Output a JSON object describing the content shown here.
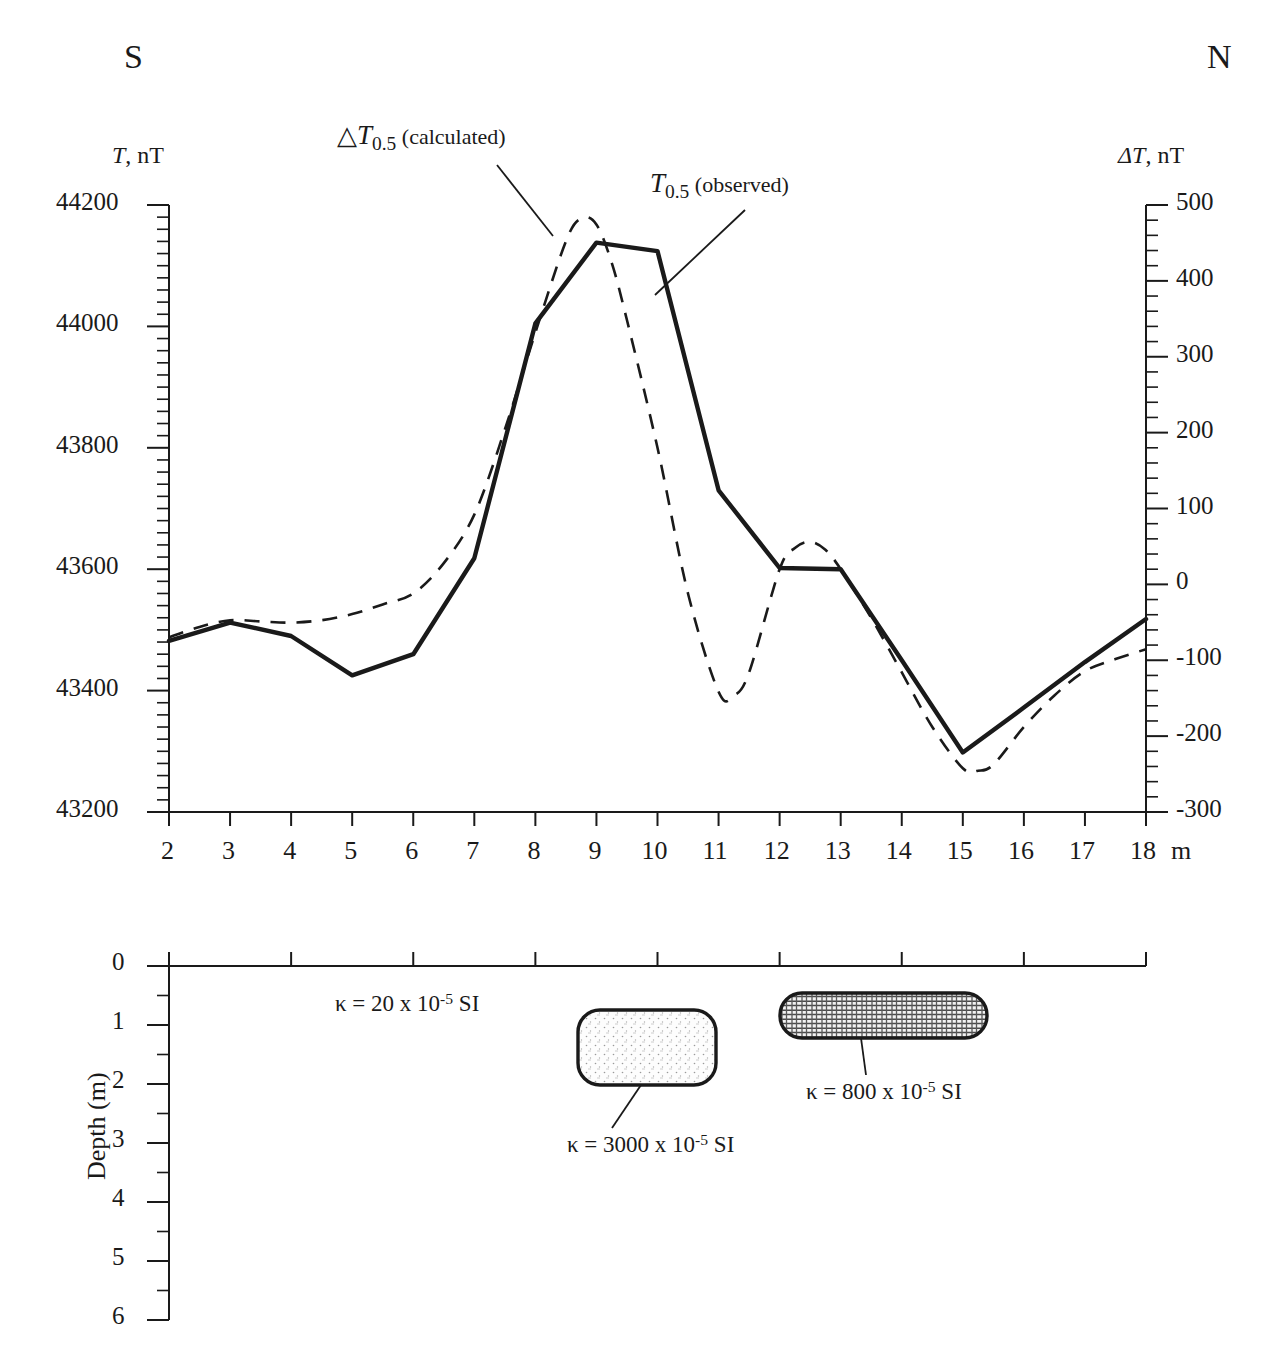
{
  "figure": {
    "compass_south": "S",
    "compass_north": "N",
    "left_axis_label_symbol": "T",
    "left_axis_label_unit": ", nT",
    "right_axis_label_symbol": "ΔT",
    "right_axis_label_unit": ", nT",
    "x_unit": "m",
    "depth_axis_label": "Depth (m)"
  },
  "curve_labels": {
    "calculated": {
      "triangle": "△",
      "symbol": "T",
      "subscript": "0.5",
      "paren": " (calculated)"
    },
    "observed": {
      "symbol": "T",
      "subscript": "0.5",
      "paren": " (observed)"
    }
  },
  "annotations": [
    {
      "id": "host-rock",
      "kappa": "κ",
      "eq": " = 20 x 10",
      "exp": "-5",
      "unit": " SI",
      "value": 20
    },
    {
      "id": "lower-body",
      "kappa": "κ",
      "eq": " = 3000 x 10",
      "exp": "-5",
      "unit": " SI",
      "value": 3000
    },
    {
      "id": "upper-body",
      "kappa": "κ",
      "eq": " = 800 x 10",
      "exp": "-5",
      "unit": " SI",
      "value": 800
    }
  ],
  "chart_data": {
    "type": "line",
    "title": "",
    "xlabel": "m",
    "ylabel": "T, nT",
    "y2label": "ΔT, nT",
    "xlim": [
      2,
      18
    ],
    "ylim": [
      43200,
      44200
    ],
    "y2lim": [
      -300,
      500
    ],
    "grid": false,
    "legend": "inline-annotations",
    "x_ticks": [
      2,
      3,
      4,
      5,
      6,
      7,
      8,
      9,
      10,
      11,
      12,
      13,
      14,
      15,
      16,
      17,
      18
    ],
    "x_tick_labels": [
      "2",
      "3",
      "4",
      "5",
      "6",
      "7",
      "8",
      "9",
      "10",
      "11",
      "12",
      "13",
      "14",
      "15",
      "16",
      "17",
      "18"
    ],
    "y_ticks": [
      43200,
      43400,
      43600,
      43800,
      44000,
      44200
    ],
    "y_tick_labels": [
      "43200",
      "43400",
      "43600",
      "43800",
      "44000",
      "44200"
    ],
    "y_minor_step": 20,
    "y2_ticks": [
      -300,
      -200,
      -100,
      0,
      100,
      200,
      300,
      400,
      500
    ],
    "y2_tick_labels": [
      "-300",
      "-200",
      "-100",
      "0",
      "100",
      "200",
      "300",
      "400",
      "500"
    ],
    "y2_minor_step": 20,
    "series": [
      {
        "name": "T0.5 (observed)",
        "style": "solid",
        "width": 4,
        "x": [
          2,
          3,
          4,
          5,
          6,
          7,
          8,
          9,
          10,
          11,
          12,
          13,
          14,
          15,
          16,
          17,
          18
        ],
        "values": [
          43482,
          43512,
          43490,
          43425,
          43460,
          43618,
          44005,
          44138,
          44124,
          43730,
          43602,
          43600,
          43450,
          43298,
          43372,
          43447,
          43518
        ]
      },
      {
        "name": "△T0.5 (calculated)",
        "style": "dashed",
        "width": 3,
        "x": [
          2,
          2.5,
          3,
          3.5,
          4,
          4.5,
          5,
          5.5,
          6,
          6.5,
          7,
          7.5,
          8,
          8.5,
          8.75,
          9,
          9.25,
          9.5,
          10,
          10.5,
          11,
          11.25,
          11.5,
          12,
          12.25,
          12.5,
          12.75,
          13,
          13.5,
          14,
          14.5,
          15,
          15.25,
          15.5,
          16,
          16.5,
          17,
          17.5,
          18
        ],
        "values": [
          43488,
          43505,
          43516,
          43514,
          43512,
          43516,
          43526,
          43542,
          43560,
          43610,
          43690,
          43830,
          43990,
          44140,
          44178,
          44168,
          44105,
          44010,
          43800,
          43560,
          43398,
          43392,
          43430,
          43600,
          43635,
          43645,
          43632,
          43600,
          43520,
          43430,
          43340,
          43272,
          43268,
          43278,
          43340,
          43392,
          43432,
          43452,
          43468
        ]
      }
    ],
    "depth_panel": {
      "ylabel": "Depth (m)",
      "ylim": [
        0,
        6
      ],
      "y_ticks": [
        0,
        1,
        2,
        3,
        4,
        5,
        6
      ],
      "y_tick_labels": [
        "0",
        "1",
        "2",
        "3",
        "4",
        "5",
        "6"
      ],
      "y_minor_step": 0.5,
      "bodies": [
        {
          "id": "lower-body",
          "x_start": 8.55,
          "x_end": 10.55,
          "depth_top": 1.15,
          "depth_bottom": 2.35,
          "fill": "stipple",
          "susceptibility": 3000
        },
        {
          "id": "upper-body",
          "x_start": 11.65,
          "x_end": 14.65,
          "depth_top": 0.6,
          "depth_bottom": 1.35,
          "fill": "hatch",
          "susceptibility": 800
        }
      ]
    }
  }
}
